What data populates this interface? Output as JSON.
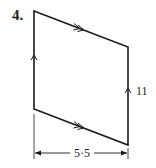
{
  "question": {
    "number": "4."
  },
  "shape": {
    "type": "parallelogram",
    "vertices": [
      [
        34,
        11
      ],
      [
        128,
        47
      ],
      [
        128,
        145
      ],
      [
        34,
        109
      ]
    ],
    "stroke_color": "#1a1a1a",
    "vertical_sides_marking": "single-arrow",
    "slanted_sides_marking": "double-arrow"
  },
  "labels": {
    "right_side": "11",
    "base_dimension": "5·5"
  }
}
